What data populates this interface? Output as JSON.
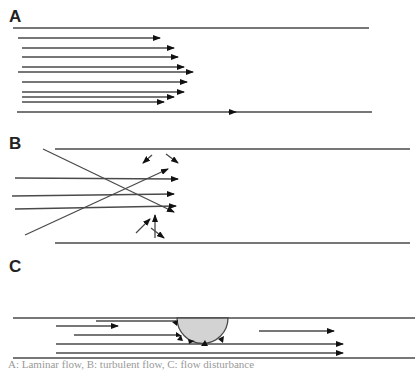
{
  "panels": [
    {
      "label": "A",
      "description": "Laminar flow: parallel flow lines with parabolic velocity profile between vessel walls"
    },
    {
      "label": "B",
      "description": "Turbulent flow: crossing and chaotic flow lines between vessel walls"
    },
    {
      "label": "C",
      "description": "Flow disturbance around a protrusion (plaque) at the vessel wall with local eddies"
    }
  ],
  "colors": {
    "line": "#4a4a4a",
    "arrow": "#111111",
    "plaque_fill": "#d3d3d3",
    "background": "#ffffff"
  },
  "caption": "A: Laminar flow, B: turbulent flow, C: flow disturbance"
}
